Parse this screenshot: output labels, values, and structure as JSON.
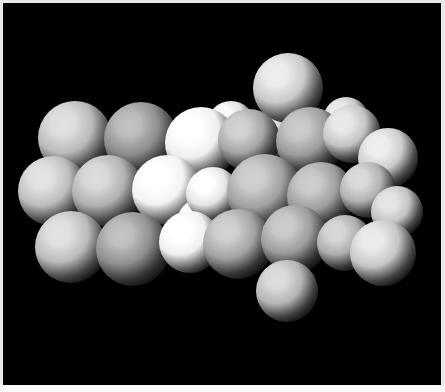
{
  "image": {
    "title": "Space-filling molecular model render",
    "width": 445,
    "height": 392,
    "background_color": "#000000",
    "border_color": "#e9e9e9",
    "bottom_strip_color": "#fbfbfb",
    "render_style": "grayscale-shaded-spheres",
    "light_direction": "upper-left",
    "atom_count": 28
  },
  "palette": {
    "white": "#ffffff",
    "bright": "#f0f0f0",
    "light": "#d2d2d2",
    "medium": "#b4b4b4",
    "mid": "#9a9a9a",
    "dark": "#7e7e7e",
    "darker": "#6a6a6a",
    "shadow": "#1a1a1a"
  },
  "scene": {
    "name": "atom-cluster",
    "atoms": [
      {
        "id": "a01",
        "cx": 288,
        "cy": 88,
        "r": 35,
        "shade": "light",
        "base": "#c9c9c9",
        "hi": "#eaeaea",
        "lo": "#4e4e4e"
      },
      {
        "id": "a02",
        "cx": 75,
        "cy": 138,
        "r": 37,
        "shade": "medium",
        "base": "#b9b9b9",
        "hi": "#dcdcdc",
        "lo": "#454545"
      },
      {
        "id": "a03",
        "cx": 141,
        "cy": 139,
        "r": 37,
        "shade": "dark",
        "base": "#8e8e8e",
        "hi": "#b8b8b8",
        "lo": "#333333"
      },
      {
        "id": "a04",
        "cx": 201,
        "cy": 143,
        "r": 36,
        "shade": "white",
        "base": "#efefef",
        "hi": "#ffffff",
        "lo": "#5e5e5e"
      },
      {
        "id": "a05",
        "cx": 249,
        "cy": 140,
        "r": 31,
        "shade": "mid",
        "base": "#a6a6a6",
        "hi": "#cccccc",
        "lo": "#3a3a3a"
      },
      {
        "id": "a06",
        "cx": 310,
        "cy": 141,
        "r": 34,
        "shade": "mid",
        "base": "#9c9c9c",
        "hi": "#c4c4c4",
        "lo": "#363636"
      },
      {
        "id": "a07",
        "cx": 352,
        "cy": 134,
        "r": 29,
        "shade": "light",
        "base": "#c4c4c4",
        "hi": "#e6e6e6",
        "lo": "#454545"
      },
      {
        "id": "a08",
        "cx": 388,
        "cy": 158,
        "r": 30,
        "shade": "light",
        "base": "#cccccc",
        "hi": "#ececec",
        "lo": "#494949"
      },
      {
        "id": "a09",
        "cx": 53,
        "cy": 191,
        "r": 35,
        "shade": "medium",
        "base": "#bdbdbd",
        "hi": "#dfdfdf",
        "lo": "#464646"
      },
      {
        "id": "a10",
        "cx": 108,
        "cy": 191,
        "r": 36,
        "shade": "medium",
        "base": "#b1b1b1",
        "hi": "#d6d6d6",
        "lo": "#414141"
      },
      {
        "id": "a11",
        "cx": 167,
        "cy": 190,
        "r": 35,
        "shade": "white",
        "base": "#f2f2f2",
        "hi": "#ffffff",
        "lo": "#626262"
      },
      {
        "id": "a12",
        "cx": 213,
        "cy": 194,
        "r": 27,
        "shade": "bright",
        "base": "#e4e4e4",
        "hi": "#ffffff",
        "lo": "#585858"
      },
      {
        "id": "a13",
        "cx": 265,
        "cy": 192,
        "r": 38,
        "shade": "mid",
        "base": "#a0a0a0",
        "hi": "#c9c9c9",
        "lo": "#373737"
      },
      {
        "id": "a14",
        "cx": 321,
        "cy": 196,
        "r": 34,
        "shade": "mid",
        "base": "#9e9e9e",
        "hi": "#c6c6c6",
        "lo": "#373737"
      },
      {
        "id": "a15",
        "cx": 368,
        "cy": 190,
        "r": 28,
        "shade": "medium",
        "base": "#b2b2b2",
        "hi": "#d6d6d6",
        "lo": "#3f3f3f"
      },
      {
        "id": "a16",
        "cx": 397,
        "cy": 212,
        "r": 26,
        "shade": "light",
        "base": "#c2c2c2",
        "hi": "#e2e2e2",
        "lo": "#444444"
      },
      {
        "id": "a17",
        "cx": 71,
        "cy": 247,
        "r": 36,
        "shade": "medium",
        "base": "#bbbbbb",
        "hi": "#dedede",
        "lo": "#454545"
      },
      {
        "id": "a18",
        "cx": 133,
        "cy": 249,
        "r": 37,
        "shade": "dark",
        "base": "#909090",
        "hi": "#bababa",
        "lo": "#343434"
      },
      {
        "id": "a19",
        "cx": 190,
        "cy": 242,
        "r": 31,
        "shade": "white",
        "base": "#f0f0f0",
        "hi": "#ffffff",
        "lo": "#606060"
      },
      {
        "id": "a20",
        "cx": 238,
        "cy": 244,
        "r": 35,
        "shade": "mid",
        "base": "#a3a3a3",
        "hi": "#cbcbcb",
        "lo": "#383838"
      },
      {
        "id": "a21",
        "cx": 295,
        "cy": 239,
        "r": 34,
        "shade": "mid",
        "base": "#9d9d9d",
        "hi": "#c5c5c5",
        "lo": "#373737"
      },
      {
        "id": "a22",
        "cx": 345,
        "cy": 243,
        "r": 28,
        "shade": "medium",
        "base": "#adadad",
        "hi": "#d2d2d2",
        "lo": "#3d3d3d"
      },
      {
        "id": "a23",
        "cx": 383,
        "cy": 253,
        "r": 33,
        "shade": "light",
        "base": "#c6c6c6",
        "hi": "#e8e8e8",
        "lo": "#464646"
      },
      {
        "id": "a24",
        "cx": 287,
        "cy": 291,
        "r": 31,
        "shade": "medium",
        "base": "#b5b5b5",
        "hi": "#d8d8d8",
        "lo": "#3f3f3f"
      },
      {
        "id": "a25",
        "cx": 231,
        "cy": 125,
        "r": 24,
        "shade": "bright",
        "base": "#e0e0e0",
        "hi": "#fbfbfb",
        "lo": "#535353"
      },
      {
        "id": "a26",
        "cx": 277,
        "cy": 133,
        "r": 25,
        "shade": "medium",
        "base": "#b8b8b8",
        "hi": "#dadada",
        "lo": "#414141"
      },
      {
        "id": "a27",
        "cx": 346,
        "cy": 120,
        "r": 23,
        "shade": "light",
        "base": "#c8c8c8",
        "hi": "#e8e8e8",
        "lo": "#464646"
      },
      {
        "id": "a28",
        "cx": 200,
        "cy": 222,
        "r": 23,
        "shade": "white",
        "base": "#f4f4f4",
        "hi": "#ffffff",
        "lo": "#636363"
      }
    ],
    "draw_order": [
      "a25",
      "a26",
      "a27",
      "a01",
      "a02",
      "a03",
      "a04",
      "a05",
      "a06",
      "a07",
      "a08",
      "a09",
      "a10",
      "a11",
      "a28",
      "a12",
      "a13",
      "a14",
      "a15",
      "a16",
      "a17",
      "a18",
      "a19",
      "a20",
      "a21",
      "a22",
      "a23",
      "a24"
    ]
  }
}
